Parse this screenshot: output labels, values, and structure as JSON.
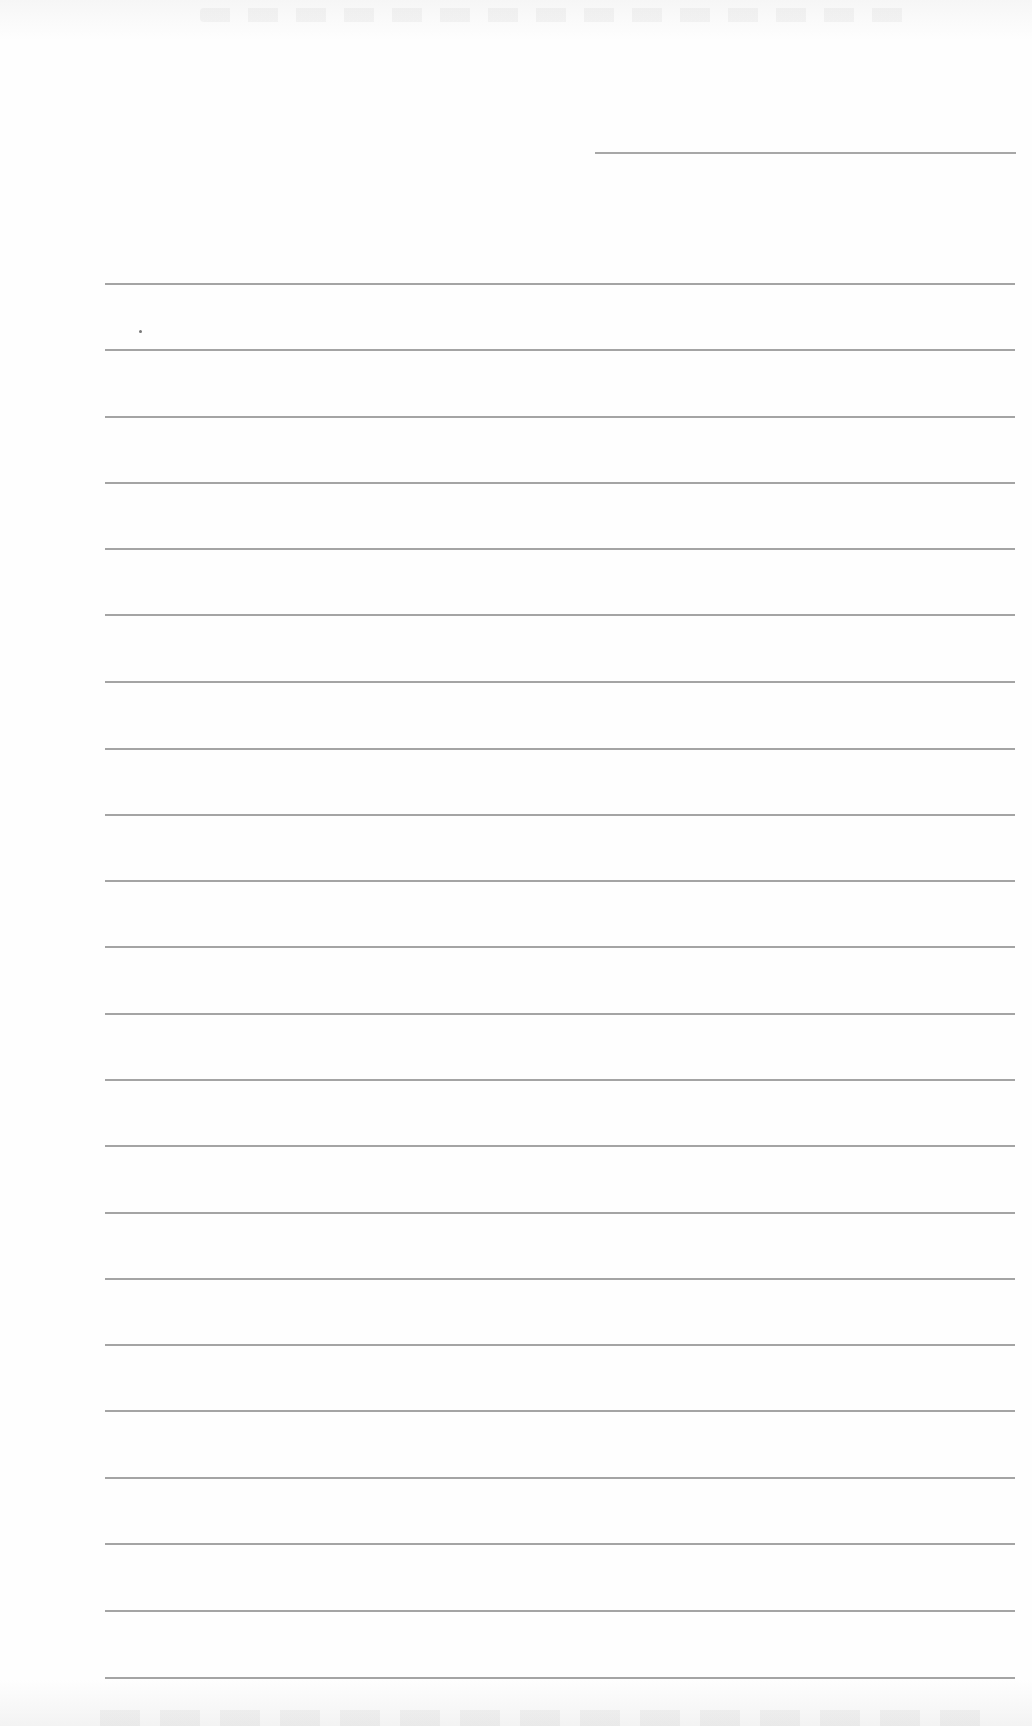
{
  "page": {
    "type": "blank lined paper",
    "background_color": "#fdfdfd",
    "rule_color": "#8d8d8d"
  },
  "header_line": {
    "x1": 595,
    "x2": 1016,
    "y": 152
  },
  "margin_mark": {
    "x": 139,
    "y": 330
  },
  "ruled_lines": {
    "x1": 105,
    "x2": 1015,
    "y_positions": [
      283,
      349,
      416,
      482,
      548,
      614,
      681,
      748,
      814,
      880,
      946,
      1013,
      1079,
      1145,
      1212,
      1278,
      1344,
      1410,
      1477,
      1543,
      1610,
      1677
    ]
  }
}
